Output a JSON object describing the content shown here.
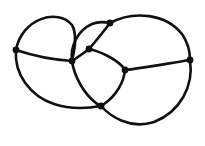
{
  "figure": {
    "kind": "planar-graph-diagram",
    "width": 205,
    "height": 146,
    "background_color": "#ffffff",
    "stroke_color": "#111111",
    "vertex_color": "#111111",
    "edge_stroke_width": 2.6,
    "vertex_radius": 3.4
  },
  "graph_data": {
    "type": "diagram",
    "node_count": 7,
    "edge_count": 11,
    "nodes": [
      {
        "id": "v1",
        "label": "left",
        "x": 16,
        "y": 50,
        "degree": 3
      },
      {
        "id": "v2",
        "label": "top",
        "x": 110,
        "y": 23,
        "degree": 4
      },
      {
        "id": "v3",
        "label": "center-left",
        "x": 72,
        "y": 61,
        "degree": 4
      },
      {
        "id": "v4",
        "label": "center-cross",
        "x": 89,
        "y": 49,
        "degree": 4
      },
      {
        "id": "v5",
        "label": "mid-right",
        "x": 125,
        "y": 70,
        "degree": 4
      },
      {
        "id": "v6",
        "label": "right",
        "x": 190,
        "y": 60,
        "degree": 3
      },
      {
        "id": "v7",
        "label": "bottom",
        "x": 101,
        "y": 106,
        "degree": 4
      }
    ],
    "edges": [
      {
        "id": "e1",
        "from": "v1",
        "to": "v3",
        "path": "M 16 50 C 22 18, 58 8, 72 25 C 78 35, 74 52, 72 61"
      },
      {
        "id": "e2",
        "from": "v1",
        "to": "v3",
        "path": "M 16 50 C 34 56, 56 60, 72 61"
      },
      {
        "id": "e3",
        "from": "v1",
        "to": "v7",
        "path": "M 16 50 C 14 74, 30 96, 54 104 C 72 110, 90 108, 101 106"
      },
      {
        "id": "e4",
        "from": "v3",
        "to": "v2",
        "path": "M 72 61 C 70 46, 78 30, 92 24 C 99 21, 105 22, 110 23"
      },
      {
        "id": "e5",
        "from": "v3",
        "to": "v4",
        "path": "M 72 61 C 78 57, 84 53, 89 49"
      },
      {
        "id": "e6",
        "from": "v2",
        "to": "v4",
        "path": "M 110 23 C 104 31, 95 42, 89 49"
      },
      {
        "id": "e7",
        "from": "v4",
        "to": "v5",
        "path": "M 89 49 C 99 51, 114 58, 122 66 C 123 67, 124 69, 125 70"
      },
      {
        "id": "e8",
        "from": "v2",
        "to": "v6",
        "path": "M 110 23 C 134 10, 166 14, 182 34 C 189 44, 190 53, 190 60"
      },
      {
        "id": "e9",
        "from": "v5",
        "to": "v6",
        "path": "M 125 70 C 145 68, 170 63, 190 60"
      },
      {
        "id": "e10",
        "from": "v3",
        "to": "v7",
        "path": "M 72 61 C 74 76, 84 94, 96 103 C 98 105, 100 106, 101 106"
      },
      {
        "id": "e11",
        "from": "v5",
        "to": "v7",
        "path": "M 125 70 C 124 82, 116 96, 104 104 C 103 105, 102 106, 101 106"
      },
      {
        "id": "e12",
        "from": "v6",
        "to": "v7",
        "path": "M 190 60 C 194 86, 180 112, 154 122 C 130 130, 110 116, 101 106"
      }
    ]
  }
}
